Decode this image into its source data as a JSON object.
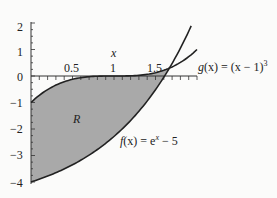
{
  "chart_data": {
    "type": "line",
    "title": "",
    "xlabel": "x",
    "ylabel": "",
    "xlim": [
      0,
      2.0
    ],
    "ylim": [
      -4,
      2.5
    ],
    "x_ticks": [
      "0.5",
      "1",
      "1.5"
    ],
    "y_ticks": [
      "2",
      "1",
      "0",
      "-1",
      "-2",
      "-3",
      "-4"
    ],
    "grid": false,
    "series": [
      {
        "name": "f(x) = e^x − 5",
        "label": "f(x) = eˣ − 5",
        "formula": "exp(x)-5",
        "x": [
          0,
          0.5,
          1,
          1.5,
          1.61,
          1.9
        ],
        "y": [
          -4,
          -3.35,
          -2.28,
          -0.52,
          0.0,
          1.69
        ]
      },
      {
        "name": "g(x) = (x − 1)^3",
        "label": "g(x) = (x − 1)³",
        "formula": "(x-1)^3",
        "x": [
          0,
          0.5,
          1,
          1.5,
          1.61,
          2.0
        ],
        "y": [
          -1,
          -0.125,
          0,
          0.125,
          0.23,
          1.0
        ]
      }
    ],
    "shaded_region": {
      "label": "R",
      "between": [
        "g(x)",
        "f(x)"
      ],
      "x_range": [
        0,
        1.61
      ]
    },
    "annotations": [
      "R",
      "x"
    ]
  },
  "labels": {
    "x_axis": "x",
    "region": "R",
    "f_label_pre": "f",
    "f_label_post": "(x) = e",
    "f_label_sup": "x",
    "f_label_end": " − 5",
    "g_label_pre": "g",
    "g_label_post": "(x) = (x − 1)",
    "g_label_sup": "3"
  },
  "ticks": {
    "x": [
      "0.5",
      "1",
      "1.5"
    ],
    "y": [
      "2",
      "1",
      "0",
      "−1",
      "−2",
      "−3",
      "−4"
    ]
  }
}
